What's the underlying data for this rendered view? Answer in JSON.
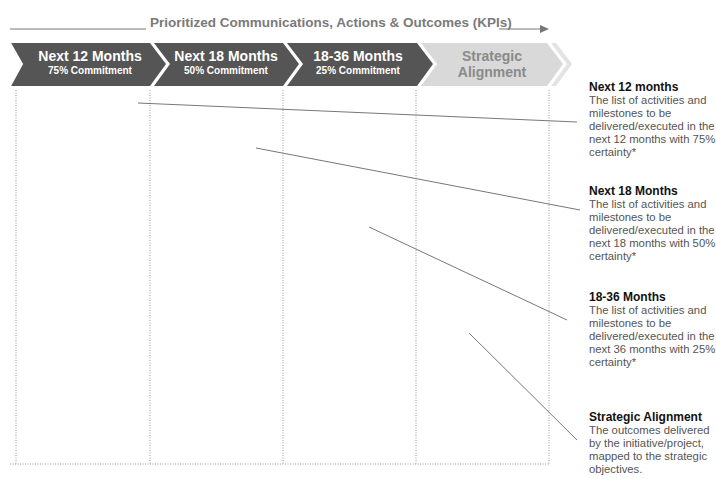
{
  "header": {
    "title": "Prioritized Communications, Actions & Outcomes (KPIs)",
    "arrow_icon": "right-arrow"
  },
  "chevrons": [
    {
      "title": "Next 12 Months",
      "subtitle": "75% Commitment",
      "color": "#555555"
    },
    {
      "title": "Next 18 Months",
      "subtitle": "50% Commitment",
      "color": "#555555"
    },
    {
      "title": "18-36 Months",
      "subtitle": "25% Commitment",
      "color": "#555555"
    },
    {
      "title": "Strategic",
      "title2": "Alignment",
      "color": "#d9d9d9"
    }
  ],
  "descriptions": [
    {
      "heading": "Next 12 months",
      "body": "The list of activities and milestones to be delivered/executed in the next 12 months with 75% certainty*"
    },
    {
      "heading": "Next 18 Months",
      "body": "The list of activities and milestones to be delivered/executed in the next 18 months with 50% certainty*"
    },
    {
      "heading": "18-36 Months",
      "body": "The list of activities and milestones to be delivered/executed in the next 36 months with 25% certainty*"
    },
    {
      "heading": "Strategic Alignment",
      "body": "The outcomes delivered by the initiative/project, mapped to the strategic objectives."
    }
  ],
  "colors": {
    "dark_chevron": "#555555",
    "light_chevron": "#d9d9d9",
    "line": "#777777",
    "text_heading": "#111111",
    "text_body": "#555555"
  }
}
